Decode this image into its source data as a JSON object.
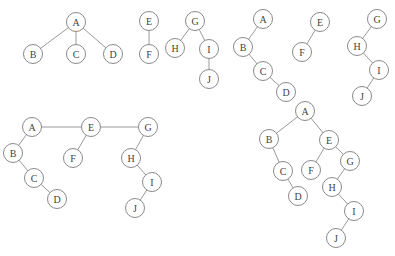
{
  "diagram": {
    "node_colors": {
      "stroke": "#8a8a8a",
      "fill": "#ffffff",
      "text": "#444444",
      "edge": "#9a9a9a"
    },
    "panels": [
      {
        "id": "original-forest",
        "description": "Three separate trees",
        "nodes": [
          "A",
          "B",
          "C",
          "D",
          "E",
          "F",
          "G",
          "H",
          "I",
          "J"
        ],
        "edges": [
          [
            "A",
            "B"
          ],
          [
            "A",
            "C"
          ],
          [
            "A",
            "D"
          ],
          [
            "E",
            "F"
          ],
          [
            "G",
            "H"
          ],
          [
            "G",
            "I"
          ],
          [
            "I",
            "J"
          ]
        ]
      },
      {
        "id": "each-tree-as-binary",
        "description": "Each tree converted to binary form",
        "nodes": [
          "A",
          "B",
          "C",
          "D",
          "E",
          "F",
          "G",
          "H",
          "I",
          "J"
        ],
        "edges": [
          [
            "A",
            "B"
          ],
          [
            "B",
            "C"
          ],
          [
            "C",
            "D"
          ],
          [
            "E",
            "F"
          ],
          [
            "G",
            "H"
          ],
          [
            "H",
            "I"
          ],
          [
            "I",
            "J"
          ]
        ]
      },
      {
        "id": "roots-linked",
        "description": "Roots linked as siblings",
        "nodes": [
          "A",
          "B",
          "C",
          "D",
          "E",
          "F",
          "G",
          "H",
          "I",
          "J"
        ],
        "edges": [
          [
            "A",
            "E"
          ],
          [
            "E",
            "G"
          ],
          [
            "A",
            "B"
          ],
          [
            "B",
            "C"
          ],
          [
            "C",
            "D"
          ],
          [
            "E",
            "F"
          ],
          [
            "G",
            "H"
          ],
          [
            "H",
            "I"
          ],
          [
            "I",
            "J"
          ]
        ]
      },
      {
        "id": "final-binary-tree",
        "description": "Resulting binary tree",
        "nodes": [
          "A",
          "B",
          "C",
          "D",
          "E",
          "F",
          "G",
          "H",
          "I",
          "J"
        ],
        "edges": [
          [
            "A",
            "B"
          ],
          [
            "A",
            "E"
          ],
          [
            "B",
            "C"
          ],
          [
            "C",
            "D"
          ],
          [
            "E",
            "F"
          ],
          [
            "E",
            "G"
          ],
          [
            "G",
            "H"
          ],
          [
            "H",
            "I"
          ],
          [
            "I",
            "J"
          ]
        ]
      }
    ]
  }
}
